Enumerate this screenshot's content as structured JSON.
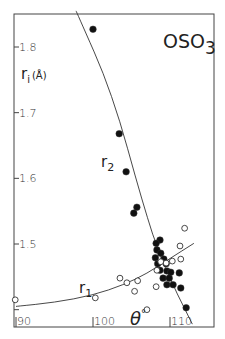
{
  "chart_data": {
    "type": "scatter",
    "title": "OSO",
    "title_subscript": "3",
    "xlabel": "θ",
    "xlabel_superscript": "°",
    "ylabel": "r",
    "ylabel_subscript": "i",
    "ylabel_unit": "(Å)",
    "xlim": [
      90,
      114.5
    ],
    "ylim": [
      1.38,
      1.855
    ],
    "x_ticks": [
      {
        "value": 90,
        "label": "90"
      },
      {
        "value": 100,
        "label": "100"
      },
      {
        "value": 110,
        "label": "110"
      }
    ],
    "y_ticks": [
      {
        "value": 1.8,
        "label": "1.8"
      },
      {
        "value": 1.7,
        "label": "1.7"
      },
      {
        "value": 1.6,
        "label": "1.6"
      },
      {
        "value": 1.5,
        "label": "1.5"
      },
      {
        "value": 1.4,
        "label": ""
      }
    ],
    "grid": false,
    "series": [
      {
        "name": "r2",
        "label": "r",
        "label_subscript": "2",
        "marker": "filled-circle",
        "points": [
          [
            100.0,
            1.827
          ],
          [
            103.4,
            1.668
          ],
          [
            104.3,
            1.61
          ],
          [
            105.7,
            1.556
          ],
          [
            105.3,
            1.547
          ],
          [
            108.7,
            1.506
          ],
          [
            108.2,
            1.501
          ],
          [
            108.3,
            1.491
          ],
          [
            108.8,
            1.486
          ],
          [
            108.1,
            1.479
          ],
          [
            109.2,
            1.477
          ],
          [
            108.4,
            1.47
          ],
          [
            109.5,
            1.47
          ],
          [
            108.7,
            1.46
          ],
          [
            109.6,
            1.459
          ],
          [
            110.1,
            1.457
          ],
          [
            109.1,
            1.448
          ],
          [
            109.9,
            1.448
          ],
          [
            111.2,
            1.456
          ],
          [
            109.6,
            1.438
          ],
          [
            110.4,
            1.438
          ],
          [
            111.4,
            1.433
          ],
          [
            112.1,
            1.403
          ]
        ],
        "fit_curve": [
          [
            97.8,
            1.855
          ],
          [
            102.5,
            1.73
          ],
          [
            106.5,
            1.56
          ],
          [
            109.0,
            1.47
          ],
          [
            112.9,
            1.378
          ]
        ]
      },
      {
        "name": "r1",
        "label": "r",
        "label_subscript": "1",
        "marker": "open-circle",
        "points": [
          [
            89.9,
            1.415
          ],
          [
            100.3,
            1.418
          ],
          [
            103.5,
            1.448
          ],
          [
            104.4,
            1.441
          ],
          [
            105.8,
            1.444
          ],
          [
            105.4,
            1.428
          ],
          [
            107.0,
            1.4
          ],
          [
            108.2,
            1.435
          ],
          [
            108.3,
            1.46
          ],
          [
            108.8,
            1.473
          ],
          [
            109.5,
            1.471
          ],
          [
            110.3,
            1.474
          ],
          [
            111.4,
            1.477
          ],
          [
            111.3,
            1.497
          ],
          [
            111.9,
            1.524
          ]
        ],
        "fit_curve": [
          [
            90.0,
            1.405
          ],
          [
            95.0,
            1.411
          ],
          [
            100.0,
            1.422
          ],
          [
            104.0,
            1.438
          ],
          [
            107.0,
            1.455
          ],
          [
            110.0,
            1.478
          ],
          [
            113.1,
            1.501
          ]
        ]
      }
    ]
  }
}
